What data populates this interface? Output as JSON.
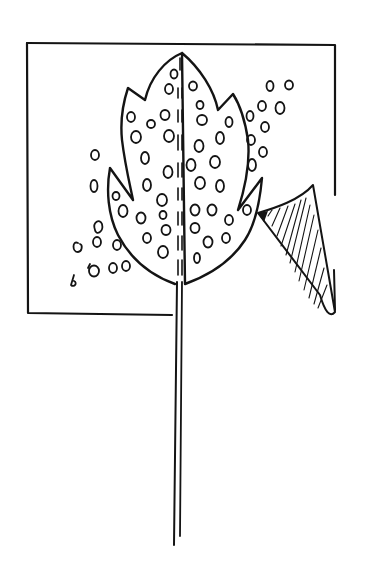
{
  "drawing": {
    "title": "Hand-drawn sketch of a spotted leaf on a long stem over a square with a peeling corner",
    "ink_color": "#141414",
    "background_color": "#ffffff",
    "elements": [
      {
        "name": "square-frame",
        "description": "Square outline, top edge y≈42–45, left edge x≈27, right edge x≈335, bottom edge y≈313 ending at the stem (x≈172)"
      },
      {
        "name": "leaf",
        "description": "Lobed leaf shape with pointed tip at top (≈182,52), two notched lobes on each side, spotted with small ovals"
      },
      {
        "name": "midrib",
        "description": "Dashed double line running down the center of the leaf"
      },
      {
        "name": "stem",
        "description": "Long double-line stem from leaf base (≈178,285) down to y≈545"
      },
      {
        "name": "peeling-corner",
        "description": "Hatched triangular flap peeling from the square's right edge, x≈258–335, y≈183–318"
      },
      {
        "name": "loose-spots-left",
        "description": "Spots scattered outside the leaf on the left, near (70–130, 150–285)"
      },
      {
        "name": "loose-spots-right",
        "description": "Spots scattered outside the leaf on the right, near (245–290, 78–170)"
      }
    ]
  }
}
